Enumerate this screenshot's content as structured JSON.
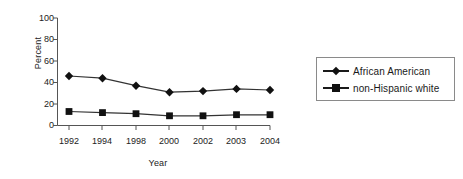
{
  "chart_data": {
    "type": "line",
    "title": "",
    "xlabel": "Year",
    "ylabel": "Percent",
    "categories": [
      "1992",
      "1994",
      "1998",
      "2000",
      "2002",
      "2003",
      "2004"
    ],
    "ylim": [
      0,
      100
    ],
    "yticks": [
      "0",
      "20",
      "40",
      "60",
      "80",
      "100"
    ],
    "grid": false,
    "legend_position": "right",
    "series": [
      {
        "name": "African American",
        "marker": "diamond",
        "color": "#111111",
        "values": [
          46,
          44,
          37,
          31,
          32,
          34,
          33
        ]
      },
      {
        "name": "non-Hispanic white",
        "marker": "square",
        "color": "#111111",
        "values": [
          13,
          12,
          11,
          9,
          9,
          10,
          10
        ]
      }
    ]
  },
  "legend": {
    "items": [
      {
        "label": "African American",
        "marker": "diamond-marker"
      },
      {
        "label": "non-Hispanic white",
        "marker": "square-marker"
      }
    ]
  }
}
